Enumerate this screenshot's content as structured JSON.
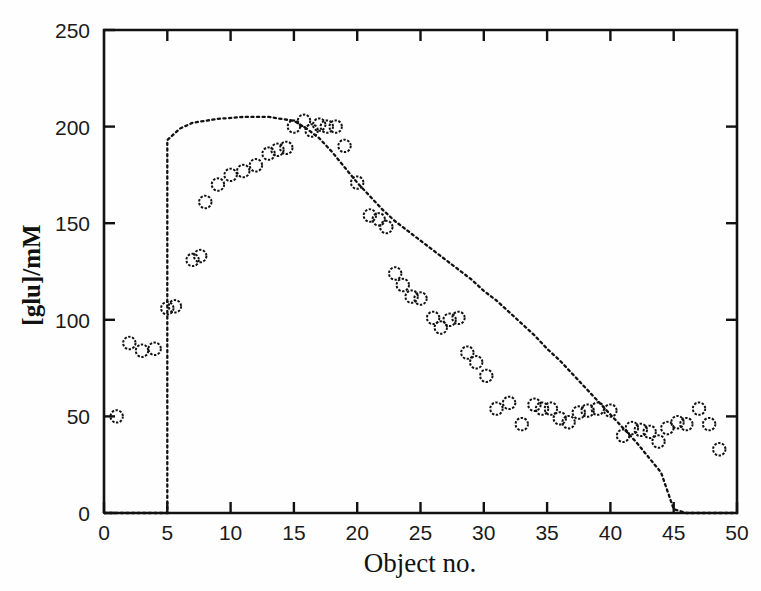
{
  "chart_data": {
    "type": "scatter",
    "title": "",
    "xlabel": "Object no.",
    "ylabel": "[glu]/mM",
    "xlim": [
      0,
      50
    ],
    "ylim": [
      0,
      250
    ],
    "xticks": [
      0,
      5,
      10,
      15,
      20,
      25,
      30,
      35,
      40,
      45,
      50
    ],
    "xticklabels": [
      "0",
      "5",
      "10",
      "15",
      "20",
      "25",
      "30",
      "35",
      "40",
      "45",
      "50"
    ],
    "yticks": [
      0,
      50,
      100,
      150,
      200,
      250
    ],
    "yticklabels": [
      "0",
      "50",
      "100",
      "150",
      "200",
      "250"
    ],
    "grid": false,
    "legend": null,
    "series": [
      {
        "name": "measured",
        "style": "open-circle-markers",
        "marker": "o",
        "color": "#111111",
        "x": [
          1,
          2,
          3,
          4,
          5,
          5.6,
          7,
          7.6,
          8,
          9,
          10,
          11,
          12,
          13,
          13.7,
          14.4,
          15,
          15.8,
          16.4,
          17,
          17.6,
          18.3,
          19,
          20,
          21,
          21.7,
          22.3,
          23,
          23.6,
          24.3,
          25,
          26,
          26.6,
          27.3,
          28,
          28.7,
          29.4,
          30.2,
          31,
          32,
          33,
          34,
          34.6,
          35.3,
          36,
          36.7,
          37.5,
          38.2,
          39,
          40,
          41,
          41.7,
          42.4,
          43.1,
          43.8,
          44.5,
          45.3,
          46,
          47,
          47.8,
          48.6
        ],
        "y": [
          50,
          88,
          84,
          85,
          106,
          107,
          131,
          133,
          161,
          170,
          175,
          177,
          180,
          186,
          188,
          189,
          200,
          203,
          198,
          201,
          200,
          200,
          190,
          171,
          154,
          152,
          148,
          124,
          118,
          112,
          111,
          101,
          96,
          100,
          101,
          83,
          78,
          71,
          54,
          57,
          46,
          56,
          54,
          54,
          49,
          47,
          52,
          53,
          54,
          53,
          40,
          44,
          43,
          42,
          37,
          44,
          47,
          46,
          54,
          46,
          33
        ]
      },
      {
        "name": "model",
        "style": "dotted-line",
        "color": "#111111",
        "x": [
          0,
          5,
          5,
          6,
          7,
          9,
          11,
          13,
          15,
          16,
          17,
          18,
          19,
          20,
          21,
          22,
          23,
          24,
          25,
          26,
          27,
          28,
          29,
          30,
          31,
          32,
          33,
          34,
          35,
          36,
          37,
          38,
          39,
          40,
          41,
          42,
          43,
          44,
          45,
          46,
          48,
          50
        ],
        "y": [
          0,
          0,
          193,
          199,
          202,
          204,
          205,
          205,
          203,
          199,
          194,
          187,
          179,
          171,
          164,
          157,
          151,
          146,
          141,
          136,
          131,
          126,
          121,
          115,
          110,
          104,
          98,
          92,
          85,
          79,
          72,
          65,
          58,
          51,
          44,
          37,
          29,
          21,
          2,
          0,
          0,
          0
        ]
      }
    ]
  },
  "axes": {
    "y_axis_title": "[glu]/mM",
    "x_axis_title": "Object no."
  },
  "colors": {
    "ink": "#111111",
    "background": "#fefefe"
  }
}
